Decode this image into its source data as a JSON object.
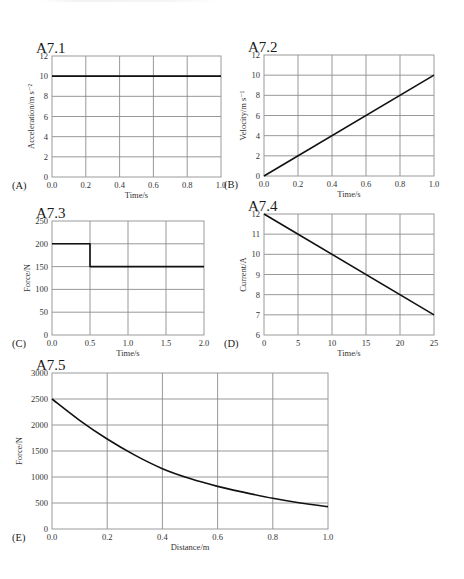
{
  "chart_data": [
    {
      "id": "A",
      "type": "line",
      "title": "A7.1",
      "panel_letter": "(A)",
      "xlabel": "Time/s",
      "ylabel": "Acceleration/m s⁻²",
      "xlim": [
        0,
        1.0
      ],
      "ylim": [
        0,
        12
      ],
      "xticks": [
        "0.0",
        "0.2",
        "0.4",
        "0.6",
        "0.8",
        "1.0"
      ],
      "yticks": [
        "0",
        "2",
        "4",
        "6",
        "8",
        "10",
        "12"
      ],
      "grid": true,
      "x": [
        0.0,
        1.0
      ],
      "y": [
        10,
        10
      ],
      "box": {
        "left": 52,
        "top": 56,
        "right": 221,
        "bottom": 177
      }
    },
    {
      "id": "B",
      "type": "line",
      "title": "A7.2",
      "panel_letter": "(B)",
      "xlabel": "Time/s",
      "ylabel": "Velocity/m s⁻¹",
      "xlim": [
        0,
        1.0
      ],
      "ylim": [
        0,
        12
      ],
      "xticks": [
        "0.0",
        "0.2",
        "0.4",
        "0.6",
        "0.8",
        "1.0"
      ],
      "yticks": [
        "0",
        "2",
        "4",
        "6",
        "8",
        "10",
        "12"
      ],
      "grid": true,
      "x": [
        0.0,
        1.0
      ],
      "y": [
        0,
        10
      ],
      "box": {
        "left": 264,
        "top": 55,
        "right": 434,
        "bottom": 176
      }
    },
    {
      "id": "C",
      "type": "line",
      "title": "A7.3",
      "panel_letter": "(C)",
      "xlabel": "Time/s",
      "ylabel": "Force/N",
      "xlim": [
        0,
        2.0
      ],
      "ylim": [
        0,
        250
      ],
      "xticks": [
        "0.0",
        "0.5",
        "1.0",
        "1.5",
        "2.0"
      ],
      "yticks": [
        "0",
        "50",
        "100",
        "150",
        "200",
        "250"
      ],
      "grid": true,
      "x": [
        0.0,
        0.5,
        0.5,
        2.0
      ],
      "y": [
        200,
        200,
        150,
        150
      ],
      "box": {
        "left": 52,
        "top": 221,
        "right": 204,
        "bottom": 335
      }
    },
    {
      "id": "D",
      "type": "line",
      "title": "A7.4",
      "panel_letter": "(D)",
      "xlabel": "Time/s",
      "ylabel": "Current/A",
      "xlim": [
        0,
        25
      ],
      "ylim": [
        6,
        12
      ],
      "xticks": [
        "0",
        "5",
        "10",
        "15",
        "20",
        "25"
      ],
      "yticks": [
        "6",
        "7",
        "8",
        "9",
        "10",
        "11",
        "12"
      ],
      "grid": true,
      "x": [
        0,
        25
      ],
      "y": [
        12,
        7
      ],
      "box": {
        "left": 264,
        "top": 214,
        "right": 434,
        "bottom": 335
      }
    },
    {
      "id": "E",
      "type": "line",
      "title": "A7.5",
      "panel_letter": "(E)",
      "xlabel": "Distance/m",
      "ylabel": "Force/N",
      "xlim": [
        0,
        1.0
      ],
      "ylim": [
        0,
        3000
      ],
      "xticks": [
        "0.0",
        "0.2",
        "0.4",
        "0.6",
        "0.8",
        "1.0"
      ],
      "yticks": [
        "0",
        "500",
        "1000",
        "1500",
        "2000",
        "2500",
        "3000"
      ],
      "grid": true,
      "x": [
        0.0,
        0.1,
        0.2,
        0.3,
        0.4,
        0.5,
        0.6,
        0.7,
        0.8,
        0.9,
        1.0
      ],
      "y": [
        2500,
        2090,
        1730,
        1420,
        1160,
        970,
        820,
        700,
        590,
        500,
        430
      ],
      "box": {
        "left": 52,
        "top": 373,
        "right": 328,
        "bottom": 529
      }
    }
  ]
}
